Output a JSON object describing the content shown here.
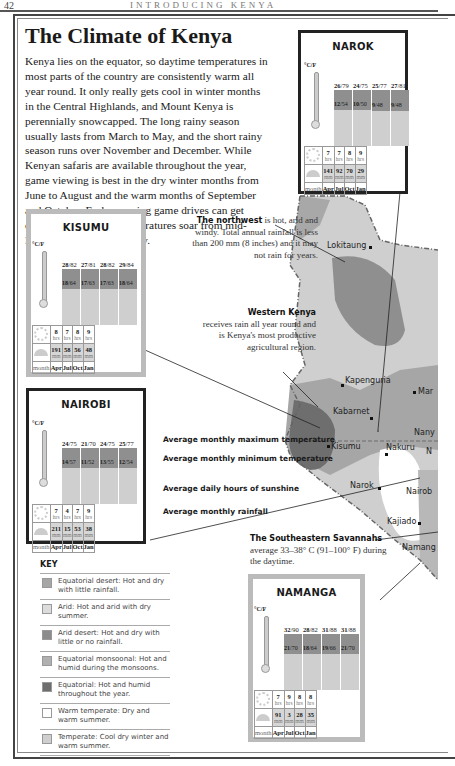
{
  "page": {
    "number": "42",
    "running_head": "INTRODUCING KENYA"
  },
  "article": {
    "title": "The Climate of Kenya",
    "intro": "Kenya lies on the equator, so daytime temperatures in most parts of the country are consistently warm all year round. It only really gets cool in winter months in the Central Highlands, and Mount Kenya is perennially snowcapped. The long rainy season usually lasts from March to May, and the short rainy season runs over November and December. While Kenyan safaris are available throughout the year, game viewing is best in the dry winter months from June to August and the warm months of September and October. Early morning game drives can get chilly. On the coast, temperatures soar from mid-December to mid-February."
  },
  "chart_data": [
    {
      "type": "table",
      "title": "NAROK",
      "months": [
        "Apr",
        "Jul",
        "Oct",
        "Jan"
      ],
      "max_c": [
        26,
        24,
        25,
        27
      ],
      "max_f": [
        79,
        75,
        77,
        81
      ],
      "min_c": [
        12,
        10,
        9,
        9
      ],
      "min_f": [
        54,
        50,
        48,
        48
      ],
      "sun_hrs": [
        7,
        7,
        8,
        9
      ],
      "rain_mm": [
        141,
        92,
        70,
        29
      ]
    },
    {
      "type": "table",
      "title": "KISUMU",
      "months": [
        "Apr",
        "Jul",
        "Oct",
        "Jan"
      ],
      "max_c": [
        28,
        27,
        28,
        29
      ],
      "max_f": [
        82,
        81,
        82,
        84
      ],
      "min_c": [
        18,
        17,
        17,
        18
      ],
      "min_f": [
        64,
        63,
        63,
        64
      ],
      "sun_hrs": [
        8,
        7,
        8,
        9
      ],
      "rain_mm": [
        191,
        58,
        56,
        48
      ]
    },
    {
      "type": "table",
      "title": "NAIROBI",
      "months": [
        "Apr",
        "Jul",
        "Oct",
        "Jan"
      ],
      "max_c": [
        24,
        21,
        24,
        25
      ],
      "max_f": [
        75,
        70,
        75,
        77
      ],
      "min_c": [
        14,
        11,
        13,
        12
      ],
      "min_f": [
        57,
        52,
        55,
        54
      ],
      "sun_hrs": [
        7,
        4,
        7,
        9
      ],
      "rain_mm": [
        211,
        15,
        53,
        38
      ]
    },
    {
      "type": "table",
      "title": "NAMANGA",
      "months": [
        "Apr",
        "Jul",
        "Oct",
        "Jan"
      ],
      "max_c": [
        32,
        28,
        31,
        31
      ],
      "max_f": [
        90,
        82,
        88,
        88
      ],
      "min_c": [
        21,
        18,
        19,
        21
      ],
      "min_f": [
        70,
        64,
        66,
        70
      ],
      "sun_hrs": [
        7,
        9,
        8,
        8
      ],
      "rain_mm": [
        91,
        3,
        28,
        35
      ]
    }
  ],
  "labels": {
    "unit": "°C/F",
    "hrs": "hrs",
    "mm": "mm",
    "month": "month"
  },
  "legend_labels": {
    "max": "Average monthly maximum temperature",
    "min": "Average monthly minimum temperature",
    "sun": "Average daily hours of sunshine",
    "rain": "Average monthly rainfall"
  },
  "annotations": {
    "northwest_bold": "The northwest",
    "northwest_text": " is hot, arid and windy. Total annual rainfall is less than 200 mm (8 inches) and it may not rain for years.",
    "western_bold": "Western Kenya",
    "western_text": "receives rain all year round and is Kenya's most productive agricultural region.",
    "southeast_bold": "The Southeastern Savannahs",
    "southeast_text": "average 33–38° C (91–100° F) during the daytime."
  },
  "towns": [
    "Lokitaung",
    "Kapenguria",
    "Mar",
    "Kabarnet",
    "Nany",
    "Kisumu",
    "Nakuru",
    "N",
    "Narok",
    "Nairob",
    "Kajiado",
    "Namang"
  ],
  "key": {
    "title": "KEY",
    "items": [
      {
        "label": "Equatorial desert: Hot and dry with little rainfall.",
        "color": "#a6a6a6"
      },
      {
        "label": "Arid: Hot and arid with dry summer.",
        "color": "#dcdcdc"
      },
      {
        "label": "Arid desert: Hot and dry with little or no rainfall.",
        "color": "#8c8c8c"
      },
      {
        "label": "Equatorial monsoonal: Hot and humid during the monsoons.",
        "color": "#b0b0b0"
      },
      {
        "label": "Equatorial: Hot and humid throughout the year.",
        "color": "#6e6e6e"
      },
      {
        "label": "Warm temperate: Dry and warm summer.",
        "color": "#ffffff"
      },
      {
        "label": "Temperate: Cool dry winter and warm summer.",
        "color": "#cfcfcf"
      }
    ]
  }
}
